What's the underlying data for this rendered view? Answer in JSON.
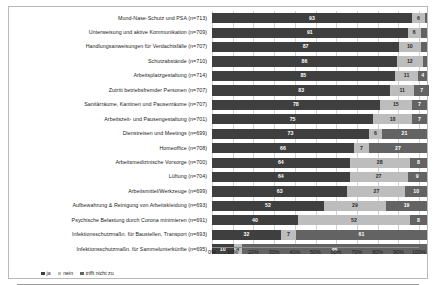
{
  "chart_data": {
    "type": "bar",
    "orientation": "horizontal",
    "stacked": true,
    "stacked_percent": true,
    "title": "",
    "subtitle": "",
    "xlabel": "",
    "ylabel": "",
    "xlim": [
      0,
      100
    ],
    "grid": true,
    "legend_position": "bottom-left",
    "xtick_labels": [
      "0%",
      "10%",
      "20%",
      "30%",
      "40%",
      "50%",
      "60%",
      "70%",
      "80%",
      "90%",
      "100%"
    ],
    "xticks": [
      0,
      10,
      20,
      30,
      40,
      50,
      60,
      70,
      80,
      90,
      100
    ],
    "series": [
      {
        "name": "ja",
        "color": "#3f3f3f",
        "values": [
          93,
          91,
          87,
          86,
          85,
          83,
          78,
          75,
          73,
          66,
          64,
          64,
          63,
          52,
          40,
          32,
          10
        ]
      },
      {
        "name": "nein",
        "color": "#bdbdbd",
        "values": [
          6,
          6,
          10,
          12,
          11,
          11,
          15,
          18,
          6,
          7,
          28,
          27,
          27,
          29,
          52,
          7,
          4
        ]
      },
      {
        "name": "trifft nicht zu",
        "color": "#636363",
        "values": [
          1,
          3,
          3,
          2,
          4,
          7,
          7,
          7,
          21,
          27,
          8,
          9,
          10,
          19,
          8,
          61,
          86
        ]
      }
    ],
    "categories": [
      "Mund-Nase-Schutz und PSA (n=713)",
      "Unterweisung und aktive Kommunikation (n=709)",
      "Handlungsanweisungen für Verdachtsfälle (n=707)",
      "Schutzabstände (n=710)",
      "Arbeitsplatzgestaltung (n=714)",
      "Zutritt betriebsfremder Personen (n=707)",
      "Sanitärräume, Kantinen und Pausenräume (n=707)",
      "Arbeitszeit- und Pausengestaltung (n=701)",
      "Dienstreisen und Meetings (n=699)",
      "Homeoffice (n=708)",
      "Arbeitsmedizinische Vorsorge (n=700)",
      "Lüftung (n=704)",
      "Arbeitsmittel/Werkzeuge (n=699)",
      "Aufbewahrung & Reinigung von Arbeitskleidung (n=693)",
      "Psychische Belastung durch Corona minimieren (n=691)",
      "Infektionsschutzmaßn. für Baustellen, Transport (n=693)",
      "Infektionsschutzmaßn. für Sammelunterkünfte (n=695)"
    ],
    "value_labels_shown": {
      "ja": [
        93,
        91,
        87,
        86,
        85,
        83,
        78,
        75,
        73,
        66,
        64,
        64,
        63,
        52,
        40,
        32,
        10
      ],
      "nein": [
        6,
        6,
        10,
        12,
        11,
        11,
        15,
        18,
        6,
        7,
        28,
        27,
        27,
        29,
        52,
        7,
        4
      ],
      "trifft nicht zu": [
        "",
        "",
        "",
        "",
        4,
        7,
        7,
        7,
        21,
        27,
        8,
        9,
        10,
        19,
        8,
        61,
        86
      ]
    }
  },
  "legend": {
    "items": [
      {
        "label": "ja",
        "color": "#3f3f3f"
      },
      {
        "label": "nein",
        "color": "#bdbdbd"
      },
      {
        "label": "trifft nicht zu",
        "color": "#636363"
      }
    ]
  },
  "colors": {
    "ja": "#3f3f3f",
    "nein": "#bdbdbd",
    "trifft_nicht_zu": "#636363",
    "grid": "#d2d2d2",
    "axis": "#8c8c8c",
    "frame": "#b9b9b9",
    "text": "#1c1c1c",
    "background": "#ffffff"
  }
}
